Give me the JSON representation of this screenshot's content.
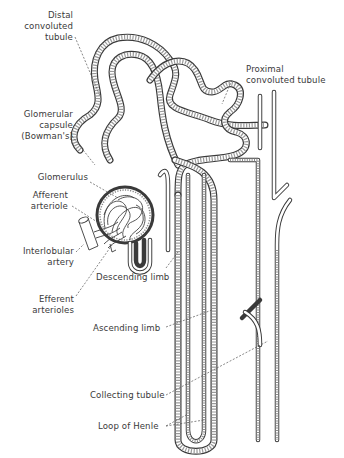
{
  "figure": {
    "line_color": "#3a3a3a",
    "background": "#ffffff",
    "labels": [
      {
        "id": "distal",
        "lines": [
          "Distal",
          "convoluted",
          "tubule"
        ]
      },
      {
        "id": "proximal",
        "lines": [
          "Proximal",
          "convoluted tubule"
        ]
      },
      {
        "id": "capsule",
        "lines": [
          "Glomerular",
          "capsule",
          "(Bowman's)"
        ]
      },
      {
        "id": "glomerulus",
        "lines": [
          "Glomerulus"
        ]
      },
      {
        "id": "afferent",
        "lines": [
          "Afferent",
          "arteriole"
        ]
      },
      {
        "id": "interlobular",
        "lines": [
          "Interlobular",
          "artery"
        ]
      },
      {
        "id": "descending",
        "lines": [
          "Descending limb"
        ]
      },
      {
        "id": "efferent",
        "lines": [
          "Efferent",
          "arterioles"
        ]
      },
      {
        "id": "ascending",
        "lines": [
          "Ascending limb"
        ]
      },
      {
        "id": "collecting",
        "lines": [
          "Collecting tubule"
        ]
      },
      {
        "id": "loop",
        "lines": [
          "Loop of Henle"
        ]
      }
    ]
  }
}
